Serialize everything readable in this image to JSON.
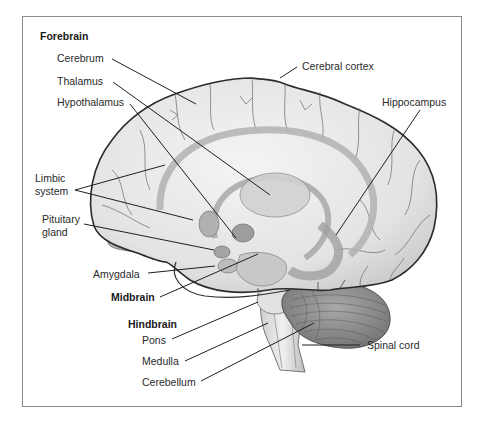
{
  "diagram": {
    "colors": {
      "frame": "#8a8a8a",
      "outline": "#2b2b2b",
      "leader": "#1f1f1f",
      "brain_fill": "#e6e6e6",
      "inner_structures": "#b9b9b9",
      "cerebellum": "#8e8e8e",
      "text": "#2a2a2a"
    },
    "groups": {
      "forebrain": "Forebrain",
      "midbrain": "Midbrain",
      "hindbrain": "Hindbrain"
    },
    "labels": {
      "cerebrum": "Cerebrum",
      "thalamus": "Thalamus",
      "hypothalamus": "Hypothalamus",
      "limbic_line1": "Limbic",
      "limbic_line2": "system",
      "pituitary_line1": "Pituitary",
      "pituitary_line2": "gland",
      "amygdala": "Amygdala",
      "pons": "Pons",
      "medulla": "Medulla",
      "cerebellum": "Cerebellum",
      "cerebral_cortex": "Cerebral cortex",
      "hippocampus": "Hippocampus",
      "spinal_cord": "Spinal cord"
    }
  }
}
